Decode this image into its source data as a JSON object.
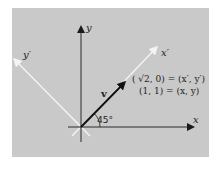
{
  "figure": {
    "background_color": "#c9c9c9",
    "axis_color": "#1a1a1a",
    "rotated_axis_color": "#f4f4f4",
    "vector_color": "#111111"
  },
  "labels": {
    "y_axis": "y",
    "x_axis": "x",
    "y_prime_axis": "y′",
    "x_prime_axis": "x′",
    "vector": "v",
    "angle": "45°",
    "equation_rotated": "( √2, 0) = (x′, y′)",
    "equation_original": "(1, 1) = (x, y)"
  },
  "geometry": {
    "origin": [
      81,
      127
    ],
    "rotation_angle_deg": 45,
    "vector_original_coords": [
      1,
      1
    ],
    "vector_rotated_coords": [
      "√2",
      0
    ]
  }
}
